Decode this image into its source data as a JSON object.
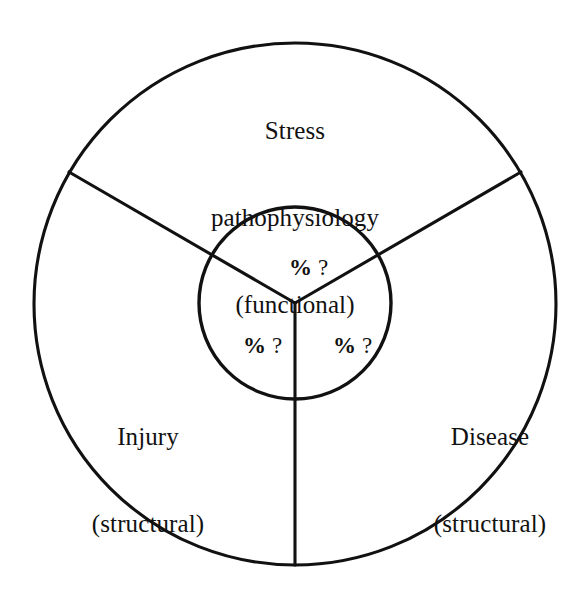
{
  "diagram": {
    "type": "concentric-sector-diagram",
    "background_color": "#ffffff",
    "stroke_color": "#111111",
    "outer_circle": {
      "center_x": 295,
      "center_y": 304,
      "radius": 261
    },
    "inner_circle": {
      "center_x": 295,
      "center_y": 303,
      "radius": 96
    },
    "divider_angles_deg": [
      90,
      210,
      330
    ],
    "outer_segments": [
      {
        "id": "stress",
        "line1": "Stress",
        "line2": "pathophysiology",
        "line3": "(functional)"
      },
      {
        "id": "injury",
        "line1": "Injury",
        "line2": "(structural)"
      },
      {
        "id": "disease",
        "line1": "Disease",
        "line2": "(structural)"
      }
    ],
    "inner_segments": [
      {
        "id": "top",
        "percent_symbol": "%",
        "query_symbol": "?"
      },
      {
        "id": "left",
        "percent_symbol": "%",
        "query_symbol": "?"
      },
      {
        "id": "right",
        "percent_symbol": "%",
        "query_symbol": "?"
      }
    ]
  }
}
